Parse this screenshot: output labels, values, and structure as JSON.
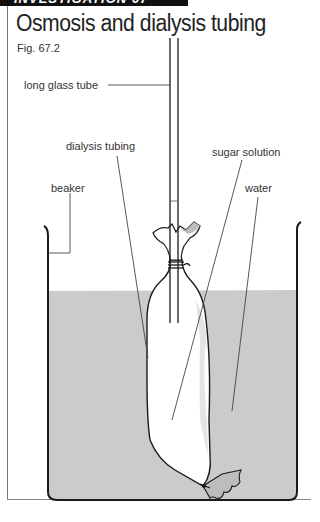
{
  "header": {
    "banner_text": "INVESTIGATION 67"
  },
  "figure": {
    "title": "Osmosis and dialysis tubing",
    "number": "Fig. 67.2"
  },
  "labels": {
    "long_glass_tube": "long glass tube",
    "dialysis_tubing": "dialysis tubing",
    "sugar_solution": "sugar solution",
    "beaker": "beaker",
    "water": "water"
  },
  "colors": {
    "water": "#cbcbcb",
    "outline": "#1a1a1a",
    "leader_line": "#444444",
    "banner": "#111111"
  }
}
